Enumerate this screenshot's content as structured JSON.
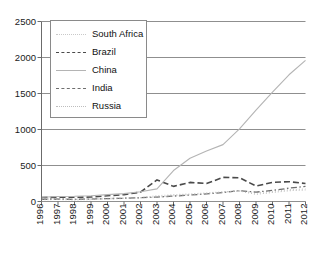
{
  "title_fragment": "",
  "chart_data": {
    "type": "line",
    "title": "",
    "xlabel": "",
    "ylabel": "",
    "ylim": [
      0,
      2500
    ],
    "yticks": [
      0,
      500,
      1000,
      1500,
      2000,
      2500
    ],
    "ytick_labels": [
      "0",
      "500",
      "1000",
      "1500",
      "2000",
      "2500"
    ],
    "grid": true,
    "legend_position": "upper left",
    "x": [
      1996,
      1997,
      1998,
      1999,
      2000,
      2001,
      2002,
      2003,
      2004,
      2005,
      2006,
      2007,
      2008,
      2009,
      2010,
      2011,
      2012
    ],
    "xtick_labels": [
      "1996",
      "1997",
      "1998",
      "1999",
      "2000",
      "2001",
      "2002",
      "2003",
      "2004",
      "2005",
      "2006",
      "2007",
      "2008",
      "2009",
      "2010",
      "2011",
      "2012"
    ],
    "series": [
      {
        "name": "South Africa",
        "style": "dotted",
        "color": "#c9c9c9",
        "values": [
          40,
          42,
          38,
          40,
          45,
          50,
          55,
          80,
          95,
          105,
          120,
          135,
          150,
          120,
          140,
          165,
          175
        ]
      },
      {
        "name": "Brazil",
        "style": "dashed",
        "color": "#4a4a4a",
        "values": [
          55,
          60,
          58,
          62,
          80,
          95,
          130,
          300,
          210,
          265,
          250,
          335,
          330,
          215,
          265,
          275,
          250
        ]
      },
      {
        "name": "China",
        "style": "solid",
        "color": "#b4b4b4",
        "values": [
          60,
          70,
          72,
          80,
          95,
          110,
          135,
          175,
          430,
          600,
          700,
          790,
          1010,
          1270,
          1520,
          1760,
          1960
        ]
      },
      {
        "name": "India",
        "style": "dashdot",
        "color": "#6e6e6e",
        "values": [
          30,
          32,
          30,
          34,
          40,
          45,
          52,
          62,
          75,
          90,
          105,
          125,
          150,
          130,
          155,
          185,
          210
        ]
      },
      {
        "name": "Russia",
        "style": "dotted",
        "color": "#bdbdbd",
        "values": [
          25,
          28,
          22,
          26,
          35,
          42,
          50,
          62,
          80,
          95,
          110,
          130,
          145,
          100,
          125,
          150,
          160
        ]
      }
    ]
  },
  "legend": {
    "items": [
      {
        "label": "South Africa",
        "key": "southafrica"
      },
      {
        "label": "Brazil",
        "key": "brazil"
      },
      {
        "label": "China",
        "key": "china"
      },
      {
        "label": "India",
        "key": "india"
      },
      {
        "label": "Russia",
        "key": "russia"
      }
    ]
  }
}
